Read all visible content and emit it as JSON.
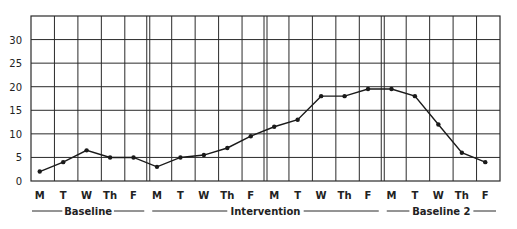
{
  "chart_data": {
    "type": "line",
    "title": "",
    "xlabel": "",
    "ylabel": "",
    "ylim": [
      0,
      35
    ],
    "yticks": [
      0,
      5,
      10,
      15,
      20,
      25,
      30
    ],
    "grid": true,
    "legend": null,
    "categories": [
      "M",
      "T",
      "W",
      "Th",
      "F",
      "M",
      "T",
      "W",
      "Th",
      "F",
      "M",
      "T",
      "W",
      "Th",
      "F",
      "M",
      "T",
      "W",
      "Th",
      "F"
    ],
    "phases": [
      {
        "label": "Baseline",
        "start": 0,
        "end": 4
      },
      {
        "label": "Intervention",
        "start": 5,
        "end": 14
      },
      {
        "label": "Baseline 2",
        "start": 15,
        "end": 19
      }
    ],
    "series": [
      {
        "name": "Behavior frequency",
        "values": [
          2,
          4,
          6.5,
          5,
          5,
          3,
          5,
          5.5,
          7,
          9.5,
          11.5,
          13,
          18,
          18,
          19.5,
          19.5,
          18,
          12,
          6,
          4
        ]
      }
    ],
    "week_separators_after": [
      4,
      9,
      14
    ]
  },
  "colors": {
    "line": "#1a1a1a",
    "grid": "#2a2a2a",
    "background": "#ffffff"
  }
}
